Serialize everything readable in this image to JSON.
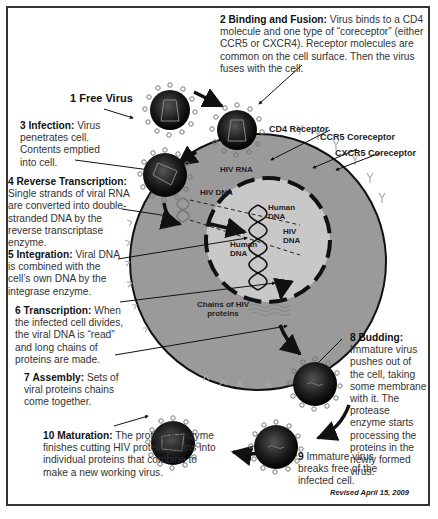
{
  "steps": [
    {
      "num": "1",
      "title": "Free Virus",
      "text": ""
    },
    {
      "num": "2",
      "title": "Binding and Fusion:",
      "text": "Virus binds to a CD4 molecule and one type of “coreceptor” (either CCR5 or CXCR4). Receptor molecules are common on the cell surface. Then the virus fuses with the cell."
    },
    {
      "num": "3",
      "title": "Infection:",
      "text": "Virus penetrates cell. Contents emptied into cell."
    },
    {
      "num": "4",
      "title": "Reverse Transcription:",
      "text": "Single strands of viral RNA are converted into double-stranded DNA by the reverse transcriptase enzyme."
    },
    {
      "num": "5",
      "title": "Integration:",
      "text": "Viral DNA is combined with the cell’s own DNA by the integrase enzyme."
    },
    {
      "num": "6",
      "title": "Transcription:",
      "text": "When the infected cell divides, the viral DNA is “read” and long chains of proteins are made."
    },
    {
      "num": "7",
      "title": "Assembly:",
      "text": "Sets of viral proteins chains come together."
    },
    {
      "num": "8",
      "title": "Budding:",
      "text": "Immature virus pushes out of the cell, taking some membrane with it. The protease enzyme starts processing the proteins in the newly formed virus."
    },
    {
      "num": "9",
      "title": "",
      "text": "Immature virus breaks free of the infected cell."
    },
    {
      "num": "10",
      "title": "Maturation:",
      "text": "The protease enzyme finishes cutting HIV protein chains into individual proteins that combine to make a new working virus."
    }
  ],
  "labels": {
    "cd4": "CD4 Receptor",
    "ccr5": "CCR5 Coreceptor",
    "cxcr5": "CXCR5 Coreceptor",
    "hiv_rna": "HIV RNA",
    "hiv_dna": "HIV DNA",
    "human_dna_1": "Human DNA",
    "human_dna_2": "Human DNA",
    "hiv_dna_nucleus": "HIV DNA",
    "protein_chains": "Chains of HIV proteins"
  },
  "footer": {
    "revised": "Revised April 15, 2009"
  },
  "colors": {
    "cell": "#9a9a9a",
    "nucleus": "#c8c8c8",
    "virus": "#1a1a1a",
    "border": "#333333"
  }
}
